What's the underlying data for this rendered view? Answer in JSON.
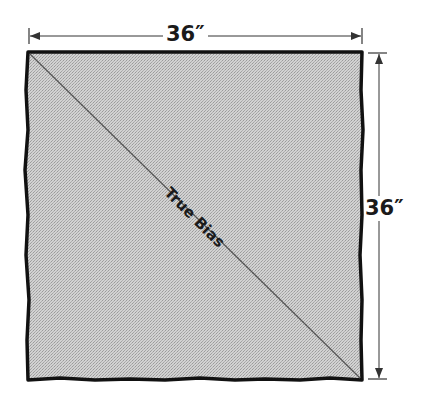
{
  "diagram": {
    "width_label": "36″",
    "height_label": "36″",
    "diagonal_label": "True Bias",
    "colors": {
      "fabric_fill": "#c9c9c9",
      "outline": "#111111",
      "dimension_line": "#333333",
      "background": "#ffffff"
    },
    "square": {
      "x": 28,
      "y": 52,
      "width": 334,
      "height": 328
    },
    "dimensions": {
      "width_in": 36,
      "height_in": 36
    }
  }
}
